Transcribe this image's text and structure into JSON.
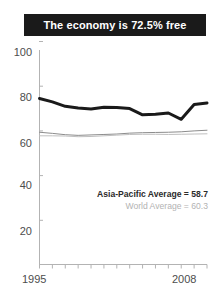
{
  "title": {
    "text": "The economy is 72.5% free"
  },
  "legend": {
    "asia_pacific": "Asia-Pacific Average = 58.7",
    "world": "World Average = 60.3"
  },
  "axis": {
    "y_ticks": [
      "100",
      "80",
      "60",
      "40",
      "20"
    ],
    "x_start": "1995",
    "x_end": "2008"
  },
  "colors": {
    "banner": "#1a1a1a",
    "banner_text": "#ffffff",
    "country_line": "#1a1a1a",
    "world_line": "#8c8c8c",
    "asia_line": "#bfbfbf",
    "axis": "#b3b3b3",
    "tick_text": "#4d4d4d"
  },
  "chart_data": {
    "type": "line",
    "title": "The economy is 72.5% free",
    "xlabel": "",
    "ylabel": "",
    "xlim": [
      1995,
      2008
    ],
    "ylim": [
      0,
      100
    ],
    "yticks": [
      20,
      40,
      60,
      80,
      100
    ],
    "xticks": [
      1995,
      1996,
      1997,
      1998,
      1999,
      2000,
      2001,
      2002,
      2003,
      2004,
      2005,
      2006,
      2007,
      2008
    ],
    "grid": false,
    "legend_position": "inside-right",
    "x": [
      1995,
      1996,
      1997,
      1998,
      1999,
      2000,
      2001,
      2002,
      2003,
      2004,
      2005,
      2006,
      2007,
      2008
    ],
    "series": [
      {
        "name": "Country economic freedom score",
        "color": "#1a1a1a",
        "width": 3.0,
        "values": [
          74.5,
          73.0,
          71.0,
          70.2,
          69.8,
          70.6,
          70.5,
          70.0,
          67.2,
          67.4,
          68.0,
          65.2,
          71.8,
          72.5
        ]
      },
      {
        "name": "World Average",
        "color": "#8c8c8c",
        "width": 1.0,
        "final_value": 60.3,
        "values": [
          59.4,
          58.9,
          58.3,
          58.0,
          58.2,
          58.4,
          58.6,
          59.0,
          59.2,
          59.3,
          59.4,
          59.6,
          60.0,
          60.3
        ]
      },
      {
        "name": "Asia-Pacific Average",
        "color": "#bfbfbf",
        "width": 1.0,
        "final_value": 58.7,
        "values": [
          57.8,
          57.8,
          57.7,
          57.4,
          57.5,
          57.8,
          58.1,
          58.4,
          58.5,
          58.5,
          58.4,
          58.5,
          58.6,
          58.7
        ]
      }
    ]
  }
}
